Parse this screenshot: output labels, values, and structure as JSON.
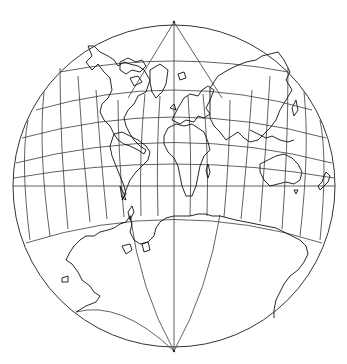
{
  "map": {
    "title": "World map in a circle (conformal projection with graticule)",
    "projection": "Lagrange-style circular world projection",
    "center": [
      174,
      186
    ],
    "radius": 161,
    "north_pole": [
      174,
      22
    ],
    "south_pole": [
      174,
      351
    ],
    "colors": {
      "background": "#ffffff",
      "graticule": "#3a3a3a",
      "coastline": "#111111",
      "outline": "#333333"
    },
    "graticule": {
      "meridian_interval_deg": 15,
      "parallel_interval_deg": 15,
      "equator_y": 186,
      "meridian_x_at_equator": [
        43,
        66,
        88,
        107,
        124,
        141,
        158,
        174,
        190,
        207,
        224,
        241,
        260,
        282,
        305
      ],
      "parallel_y_at_center": [
        92,
        117,
        141,
        164,
        186,
        216
      ]
    },
    "regions_shown": [
      "North America",
      "Greenland",
      "Europe",
      "Africa",
      "Asia",
      "South America",
      "Australia",
      "New Zealand",
      "Antarctica"
    ]
  }
}
